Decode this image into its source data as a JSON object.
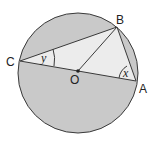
{
  "diagram": {
    "points": {
      "A": {
        "label": "A",
        "x": 136,
        "y": 81
      },
      "B": {
        "label": "B",
        "x": 117,
        "y": 27
      },
      "C": {
        "label": "C",
        "x": 20,
        "y": 61
      },
      "O": {
        "label": "O",
        "x": 78,
        "y": 71
      }
    },
    "angles": {
      "x": {
        "label": "x",
        "vertex": "A"
      },
      "y": {
        "label": "y",
        "vertex": "C"
      }
    },
    "colors": {
      "circle_fill": "#c9c9c9",
      "triangle_fill": "#ececec",
      "stroke": "#3a3a3a"
    }
  }
}
